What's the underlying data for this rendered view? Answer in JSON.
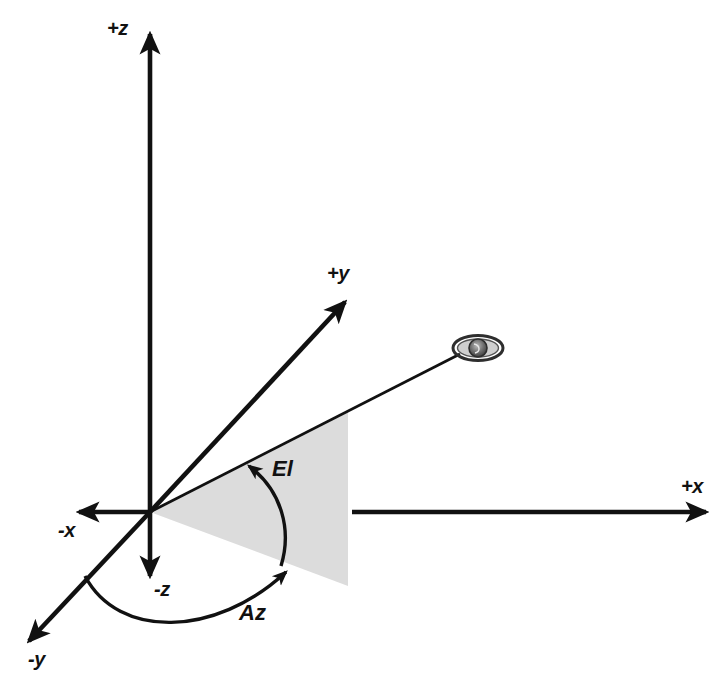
{
  "diagram": {
    "type": "3d-coordinate-frame",
    "background_color": "#ffffff",
    "line_color": "#111111",
    "wedge_fill_color": "#dcdcdc",
    "origin": {
      "x": 150,
      "y": 512
    },
    "axes": [
      {
        "id": "plus-z",
        "label": "+z",
        "label_x": 107,
        "label_y": 17,
        "from": {
          "x": 150,
          "y": 512
        },
        "to": {
          "x": 150,
          "y": 30
        },
        "arrow": true
      },
      {
        "id": "minus-z",
        "label": "-z",
        "label_x": 154,
        "label_y": 578,
        "from": {
          "x": 150,
          "y": 512
        },
        "to": {
          "x": 150,
          "y": 580
        },
        "arrow": true
      },
      {
        "id": "plus-x",
        "label": "+x",
        "label_x": 681,
        "label_y": 475,
        "from": {
          "x": 352,
          "y": 512
        },
        "to": {
          "x": 710,
          "y": 512
        },
        "arrow": true
      },
      {
        "id": "minus-x",
        "label": "-x",
        "label_x": 58,
        "label_y": 512,
        "from": {
          "x": 150,
          "y": 512
        },
        "to": {
          "x": 75,
          "y": 512
        },
        "arrow": true
      },
      {
        "id": "plus-y",
        "label": "+y",
        "label_x": 327,
        "label_y": 262,
        "from": {
          "x": 150,
          "y": 512
        },
        "to": {
          "x": 349,
          "y": 298
        },
        "arrow": true
      },
      {
        "id": "minus-y",
        "label": "-y",
        "label_x": 28,
        "label_y": 648,
        "from": {
          "x": 150,
          "y": 512
        },
        "to": {
          "x": 25,
          "y": 645
        },
        "arrow": true
      }
    ],
    "angles": [
      {
        "id": "elevation",
        "label": "El",
        "label_x": 272,
        "label_y": 456,
        "description": "Elevation angle measured from the xy-plane up to the line of sight"
      },
      {
        "id": "azimuth",
        "label": "Az",
        "label_x": 239,
        "label_y": 600,
        "description": "Azimuth angle measured in the xy-plane from the -y axis"
      }
    ],
    "target": {
      "id": "satellite",
      "icon": "satellite-icon",
      "x": 478,
      "y": 348,
      "line_from": {
        "x": 150,
        "y": 512
      },
      "line_to": {
        "x": 462,
        "y": 353
      }
    },
    "wedge": {
      "id": "elevation-wedge",
      "points": "150,512 348,411 348,586",
      "fill": "#dcdcdc"
    }
  }
}
